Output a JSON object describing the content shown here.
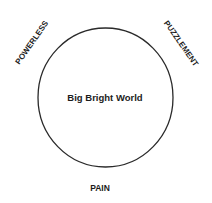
{
  "diagram": {
    "center_label": "Big Bright World",
    "labels": {
      "top_left": "POWERLESS",
      "top_right": "PUZZLEMENT",
      "bottom": "PAIN"
    },
    "colors": {
      "stroke": "#2a2a2a",
      "text": "#1c1c1c",
      "background": "#ffffff"
    }
  }
}
